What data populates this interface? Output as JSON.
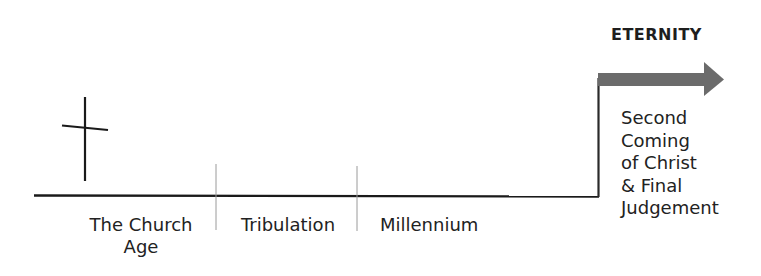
{
  "diagram": {
    "type": "timeline",
    "title": "ETERNITY",
    "periods": [
      {
        "label": "The Church Age",
        "lines": [
          "The Church",
          "Age"
        ]
      },
      {
        "label": "Tribulation"
      },
      {
        "label": "Millennium"
      }
    ],
    "event": {
      "label": "Second Coming of Christ & Final Judgement",
      "lines": [
        "Second",
        "Coming",
        "of Christ",
        "& Final",
        "Judgement"
      ]
    },
    "icons": [
      "cross-icon",
      "arrow-right-icon"
    ],
    "colors": {
      "line": "#1a1a1a",
      "tick": "#999999",
      "arrow": "#6b6b6b"
    }
  }
}
